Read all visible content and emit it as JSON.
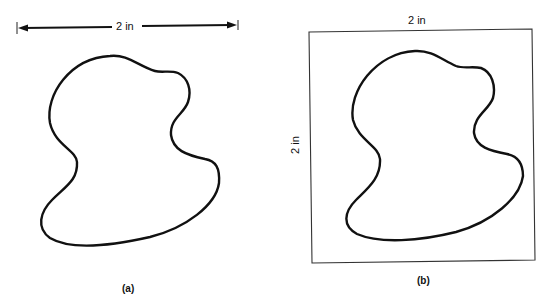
{
  "figure": {
    "panel_a": {
      "caption": "(a)",
      "dimension_label": "2 in"
    },
    "panel_b": {
      "caption": "(b)",
      "width_label": "2 in",
      "height_label": "2 in"
    },
    "colors": {
      "stroke": "#111111",
      "background": "#ffffff"
    }
  }
}
